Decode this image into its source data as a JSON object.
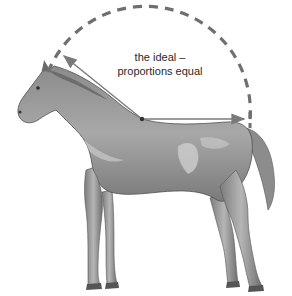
{
  "diagram": {
    "label": {
      "line1": "the ideal –",
      "line2": "proportions equal"
    },
    "colors": {
      "arc": "#6f6f6f",
      "arrow": "#7a7a7a",
      "coat_dark": "#6e6e6e",
      "coat_mid": "#9a9a9a",
      "coat_light": "#cfcfcf",
      "background": "#ffffff"
    },
    "elements": [
      {
        "type": "dashed-semicircle",
        "center": [
          153,
          120
        ],
        "radius": 100
      },
      {
        "type": "arrow",
        "from": [
          142,
          119
        ],
        "to": [
          62,
          55
        ],
        "meaning": "withers to poll (neck length)"
      },
      {
        "type": "arrow",
        "from": [
          142,
          119
        ],
        "to": [
          246,
          119
        ],
        "meaning": "withers to croup (back length)"
      },
      {
        "type": "illustration",
        "subject": "horse, side view, facing left"
      }
    ]
  }
}
